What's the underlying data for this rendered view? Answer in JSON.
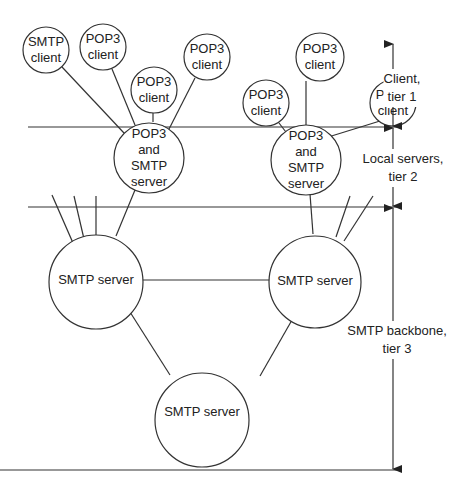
{
  "diagram": {
    "tiers": [
      {
        "id": "tier1",
        "label_line1": "Client,",
        "label_line2": "tier 1"
      },
      {
        "id": "tier2",
        "label_line1": "Local servers,",
        "label_line2": "tier 2"
      },
      {
        "id": "tier3",
        "label_line1": "SMTP backbone,",
        "label_line2": "tier 3"
      }
    ],
    "clients": [
      {
        "line1": "SMTP",
        "line2": "client"
      },
      {
        "line1": "POP3",
        "line2": "client"
      },
      {
        "line1": "POP3",
        "line2": "client"
      },
      {
        "line1": "POP3",
        "line2": "client"
      },
      {
        "line1": "POP3",
        "line2": "client"
      },
      {
        "line1": "POP3",
        "line2": "client"
      },
      {
        "line1": "POP3",
        "line2": "client"
      }
    ],
    "local_servers": [
      {
        "line1": "POP3",
        "line2": "and",
        "line3": "SMTP",
        "line4": "server"
      },
      {
        "line1": "POP3",
        "line2": "and",
        "line3": "SMTP",
        "line4": "server"
      }
    ],
    "backbone_servers": [
      {
        "label": "SMTP server"
      },
      {
        "label": "SMTP server"
      },
      {
        "label": "SMTP server"
      }
    ],
    "colors": {
      "stroke": "#333333",
      "background": "#ffffff"
    }
  }
}
